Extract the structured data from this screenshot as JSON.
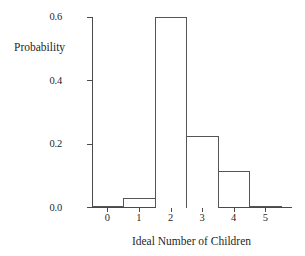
{
  "chart_data": {
    "type": "bar",
    "title": "",
    "subtitle": "",
    "xlabel": "Ideal Number of Children",
    "ylabel": "Probability",
    "categories": [
      "0",
      "1",
      "2",
      "3",
      "4",
      "5"
    ],
    "values": [
      0.005,
      0.03,
      0.6,
      0.225,
      0.115,
      0.005
    ],
    "series": [
      {
        "name": "Probability",
        "values": [
          0.005,
          0.03,
          0.6,
          0.225,
          0.115,
          0.005
        ]
      }
    ],
    "xlim": [
      -0.5,
      5.5
    ],
    "ylim": [
      0.0,
      0.6
    ],
    "y_ticks": [
      0.0,
      0.2,
      0.4,
      0.6
    ],
    "y_tick_labels": [
      "0.0",
      "0.2",
      "0.4",
      "0.6"
    ],
    "x_ticks": [
      0,
      1,
      2,
      3,
      4,
      5
    ],
    "x_tick_labels": [
      "0",
      "1",
      "2",
      "3",
      "4",
      "5"
    ],
    "grid": false,
    "legend": false,
    "legend_position": "none",
    "bar_style": "histogram-outline",
    "bar_fill": "#ffffff",
    "bar_edge_color": "#555555",
    "axis_color": "#4a4a4a",
    "background": "#ffffff",
    "annotations": []
  },
  "axes": {
    "y_title": "Probability",
    "x_title": "Ideal Number of Children"
  }
}
